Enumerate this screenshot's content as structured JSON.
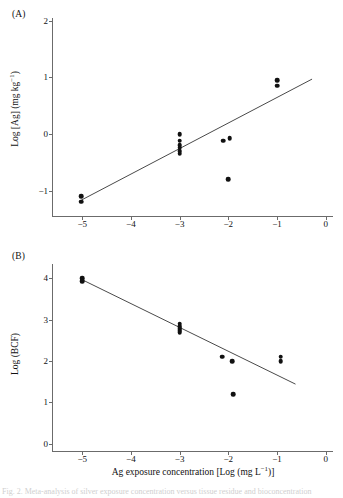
{
  "figure": {
    "background": "#ffffff",
    "ink_color": "#111111",
    "axis_color": "#6b6b6b",
    "fit_line_color": "#4a4a4a",
    "caption": "Fig. 2. Meta-analysis of silver exposure concentration versus tissue residue and bioconcentration"
  },
  "panels": [
    {
      "label": "(A)",
      "ylabel_text": "Log [Ag] (mg kg",
      "ylabel_sup": "−1",
      "ylabel_tail": ")",
      "xlabel": "",
      "yticks": [
        "2",
        "1",
        "0",
        "−1"
      ],
      "ytick_values": [
        2,
        1,
        0,
        -1
      ],
      "xticks": [
        "−5",
        "−4",
        "−3",
        "−2",
        "−1",
        "0"
      ],
      "xtick_values": [
        -5,
        -4,
        -3,
        -2,
        -1,
        0
      ]
    },
    {
      "label": "(B)",
      "ylabel_text": "Log (BCF)",
      "ylabel_sup": "",
      "ylabel_tail": "",
      "xlabel_pre": "Ag exposure concentration [Log (mg L",
      "xlabel_sup": "−1",
      "xlabel_post": ")]",
      "yticks": [
        "4",
        "3",
        "2",
        "1",
        "0"
      ],
      "ytick_values": [
        4,
        3,
        2,
        1,
        0
      ],
      "xticks": [
        "−5",
        "−4",
        "−3",
        "−2",
        "−1",
        "0"
      ],
      "xtick_values": [
        -5,
        -4,
        -3,
        -2,
        -1,
        0
      ]
    }
  ],
  "chart_data": [
    {
      "type": "scatter",
      "panel": "(A)",
      "title": "",
      "xlabel": "Ag exposure concentration [Log (mg L−1)]",
      "ylabel": "Log [Ag] (mg kg−1)",
      "xlim": [
        -5.6,
        0.15
      ],
      "ylim": [
        -1.45,
        2.05
      ],
      "grid": false,
      "legend": "none",
      "series": [
        {
          "name": "Tissue Ag residue",
          "marker": "filled-circle",
          "color": "#111111",
          "x": [
            -5.02,
            -5.02,
            -3.0,
            -3.0,
            -3.0,
            -3.0,
            -3.0,
            -3.0,
            -2.1,
            -1.97,
            -2.0,
            -1.0,
            -1.0
          ],
          "y": [
            -1.1,
            -1.2,
            0.0,
            -0.12,
            -0.2,
            -0.24,
            -0.3,
            -0.35,
            -0.12,
            -0.07,
            -0.8,
            0.95,
            0.85
          ]
        }
      ],
      "fit_line": {
        "name": "linear regression",
        "color": "#4a4a4a",
        "x": [
          -5.02,
          -0.28
        ],
        "y": [
          -1.17,
          0.97
        ],
        "slope": 0.452,
        "intercept": 1.096
      }
    },
    {
      "type": "scatter",
      "panel": "(B)",
      "title": "",
      "xlabel": "Ag exposure concentration [Log (mg L−1)]",
      "ylabel": "Log (BCF)",
      "xlim": [
        -5.6,
        0.15
      ],
      "ylim": [
        -0.18,
        4.35
      ],
      "grid": false,
      "legend": "none",
      "series": [
        {
          "name": "Bioconcentration factor",
          "marker": "filled-circle",
          "color": "#111111",
          "x": [
            -5.0,
            -5.0,
            -3.0,
            -3.0,
            -3.0,
            -3.0,
            -3.0,
            -2.12,
            -1.92,
            -1.9,
            -0.92,
            -0.92
          ],
          "y": [
            4.0,
            3.93,
            2.9,
            2.84,
            2.8,
            2.74,
            2.7,
            2.1,
            2.0,
            1.2,
            2.1,
            2.0
          ]
        }
      ],
      "fit_line": {
        "name": "linear regression",
        "color": "#4a4a4a",
        "x": [
          -5.02,
          -0.62
        ],
        "y": [
          3.98,
          1.44
        ],
        "slope": -0.577,
        "intercept": 1.085
      }
    }
  ]
}
